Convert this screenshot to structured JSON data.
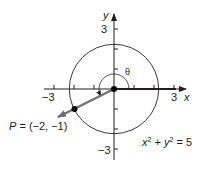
{
  "diagram": {
    "type": "coordinate-plane",
    "axes": {
      "x_label": "x",
      "y_label": "y",
      "x_ticks": [
        -3,
        -2,
        -1,
        1,
        2,
        3
      ],
      "y_ticks": [
        -3,
        -2,
        -1,
        1,
        2,
        3
      ],
      "x_tick_labels": {
        "neg3": "−3",
        "pos3": "3"
      },
      "y_tick_labels": {
        "pos3": "3",
        "neg3": "−3"
      },
      "range": [
        -3.5,
        3.5
      ]
    },
    "circle": {
      "equation_lhs_x": "x",
      "equation_exp_x": "2",
      "equation_plus": " + ",
      "equation_lhs_y": "y",
      "equation_exp_y": "2",
      "equation_rhs": " = 5",
      "radius_squared": 5
    },
    "point": {
      "name": "P",
      "label_rest": " = (−2, −1)",
      "x": -2,
      "y": -1
    },
    "angle": {
      "label": "θ"
    },
    "colors": {
      "ink": "#231f20",
      "terminal_ray": "#6d6e71",
      "circle": "#3a3a3a"
    }
  }
}
